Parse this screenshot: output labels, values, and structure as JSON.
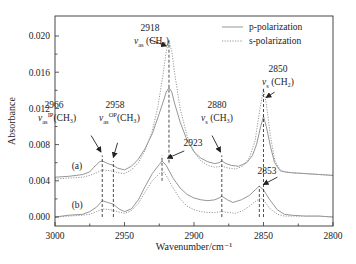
{
  "chart_data": {
    "type": "line",
    "title": "",
    "xlabel": "Wavenumber/cm⁻¹",
    "ylabel": "Absorbance",
    "xlim": [
      3000,
      2800
    ],
    "ylim": [
      -0.0005,
      0.0215
    ],
    "x_reversed": true,
    "grid": false,
    "legend_position": "upper right",
    "x_ticks": [
      3000,
      2950,
      2900,
      2850,
      2800
    ],
    "x_tick_labels": [
      "3000",
      "2950",
      "2900",
      "2850",
      "2800"
    ],
    "y_ticks": [
      0.0,
      0.004,
      0.008,
      0.012,
      0.016,
      0.02
    ],
    "y_tick_labels": [
      "0.000",
      "0.004",
      "0.008",
      "0.012",
      "0.016",
      "0.020"
    ],
    "legend": [
      {
        "name": "p-polarization",
        "style": "solid"
      },
      {
        "name": "s-polarization",
        "style": "dotted"
      }
    ],
    "series": [
      {
        "name": "(a) p-polarization",
        "group": "a",
        "style": "solid",
        "color": "#8a8a8a",
        "x": [
          3000,
          2990,
          2980,
          2975,
          2972,
          2968,
          2966,
          2962,
          2958,
          2955,
          2950,
          2945,
          2940,
          2935,
          2930,
          2926,
          2922,
          2920,
          2918,
          2916,
          2914,
          2910,
          2905,
          2900,
          2895,
          2890,
          2885,
          2882,
          2880,
          2877,
          2873,
          2868,
          2862,
          2858,
          2855,
          2852,
          2850,
          2848,
          2845,
          2842,
          2838,
          2835,
          2830,
          2820,
          2810,
          2800
        ],
        "y": [
          0.0044,
          0.0045,
          0.0047,
          0.005,
          0.0055,
          0.0061,
          0.0062,
          0.0059,
          0.0057,
          0.0054,
          0.0052,
          0.0056,
          0.0064,
          0.0076,
          0.0092,
          0.011,
          0.0128,
          0.0138,
          0.0143,
          0.0138,
          0.0126,
          0.0105,
          0.0085,
          0.0072,
          0.0065,
          0.0061,
          0.0059,
          0.006,
          0.0062,
          0.0059,
          0.0057,
          0.0056,
          0.006,
          0.0068,
          0.008,
          0.01,
          0.0111,
          0.01,
          0.0078,
          0.006,
          0.0051,
          0.005,
          0.0049,
          0.0048,
          0.0047,
          0.0046
        ]
      },
      {
        "name": "(a) s-polarization",
        "group": "a",
        "style": "dotted",
        "color": "#9a9a9a",
        "x": [
          3000,
          2990,
          2980,
          2975,
          2970,
          2966,
          2960,
          2955,
          2950,
          2945,
          2940,
          2935,
          2930,
          2926,
          2922,
          2920,
          2918,
          2916,
          2914,
          2910,
          2905,
          2900,
          2895,
          2890,
          2885,
          2880,
          2875,
          2870,
          2865,
          2860,
          2856,
          2853,
          2850,
          2848,
          2845,
          2842,
          2838,
          2835,
          2830,
          2820,
          2810,
          2800
        ],
        "y": [
          0.0042,
          0.0043,
          0.0044,
          0.0046,
          0.0049,
          0.0052,
          0.0051,
          0.0049,
          0.0048,
          0.0052,
          0.006,
          0.0074,
          0.0095,
          0.0122,
          0.016,
          0.0183,
          0.0195,
          0.0183,
          0.016,
          0.012,
          0.009,
          0.0072,
          0.0062,
          0.0057,
          0.0055,
          0.0056,
          0.0054,
          0.0053,
          0.0056,
          0.0066,
          0.0085,
          0.0115,
          0.0142,
          0.0125,
          0.009,
          0.0063,
          0.0052,
          0.005,
          0.0049,
          0.0048,
          0.0047,
          0.0046
        ]
      },
      {
        "name": "(b) p-polarization",
        "group": "b",
        "style": "solid",
        "color": "#8a8a8a",
        "x": [
          3000,
          2990,
          2980,
          2975,
          2970,
          2966,
          2962,
          2958,
          2954,
          2950,
          2945,
          2940,
          2935,
          2930,
          2925,
          2923,
          2920,
          2915,
          2910,
          2905,
          2900,
          2895,
          2890,
          2885,
          2882,
          2880,
          2876,
          2872,
          2866,
          2860,
          2856,
          2853,
          2850,
          2846,
          2840,
          2835,
          2830,
          2820,
          2810,
          2800
        ],
        "y": [
          0.0,
          0.0002,
          0.0003,
          0.0006,
          0.0011,
          0.0018,
          0.0016,
          0.0014,
          0.0009,
          0.0006,
          0.0009,
          0.0019,
          0.0034,
          0.0048,
          0.0058,
          0.0062,
          0.0057,
          0.0043,
          0.0032,
          0.0025,
          0.0021,
          0.0019,
          0.0018,
          0.0019,
          0.0021,
          0.0023,
          0.0019,
          0.0016,
          0.0019,
          0.0024,
          0.003,
          0.0034,
          0.003,
          0.002,
          0.0008,
          0.0003,
          0.0002,
          0.0001,
          0.0001,
          0.0
        ]
      },
      {
        "name": "(b) s-polarization",
        "group": "b",
        "style": "dotted",
        "color": "#9a9a9a",
        "x": [
          3000,
          2990,
          2980,
          2975,
          2970,
          2966,
          2960,
          2955,
          2950,
          2945,
          2940,
          2935,
          2930,
          2925,
          2922,
          2920,
          2915,
          2910,
          2905,
          2900,
          2895,
          2890,
          2885,
          2880,
          2875,
          2870,
          2865,
          2860,
          2856,
          2852,
          2850,
          2846,
          2840,
          2835,
          2830,
          2820,
          2810,
          2800
        ],
        "y": [
          0.0,
          0.0001,
          0.0002,
          0.0003,
          0.0006,
          0.0009,
          0.0008,
          0.0006,
          0.0004,
          0.0007,
          0.0015,
          0.0028,
          0.004,
          0.0048,
          0.005,
          0.0046,
          0.0032,
          0.002,
          0.0012,
          0.0008,
          0.0006,
          0.0005,
          0.0005,
          0.0006,
          0.0005,
          0.0004,
          0.0007,
          0.0012,
          0.0017,
          0.0021,
          0.0019,
          0.001,
          0.0003,
          0.0001,
          0.0001,
          0.0001,
          0.0001,
          0.0
        ]
      }
    ],
    "vlines": [
      {
        "x": 2966,
        "y0": 0.0,
        "y1": 0.0068
      },
      {
        "x": 2958,
        "y0": 0.0,
        "y1": 0.0062
      },
      {
        "x": 2918,
        "y0": 0.006,
        "y1": 0.0195
      },
      {
        "x": 2880,
        "y0": 0.0,
        "y1": 0.0068
      },
      {
        "x": 2850,
        "y0": 0.0,
        "y1": 0.0142
      },
      {
        "x": 2923,
        "y0": 0.004,
        "y1": 0.0068
      },
      {
        "x": 2853,
        "y0": 0.0,
        "y1": 0.0034
      }
    ],
    "annotations": [
      {
        "id": "a2966",
        "num": "2966",
        "mode": "ν",
        "sub": "as",
        "sup": "ip",
        "group": "(CH₃)",
        "tx": 44,
        "ty": 0.012,
        "ax1": 2974,
        "ay1": 0.009,
        "ax2": 2967,
        "ay2": 0.0072
      },
      {
        "id": "a2958",
        "num": "2958",
        "mode": "ν",
        "sub": "as",
        "sup": "op",
        "group": "(CH₃)",
        "tx": 105,
        "ty": 0.012,
        "ax1": 2955,
        "ay1": 0.0082,
        "ax2": 2958,
        "ay2": 0.0066
      },
      {
        "id": "a2918",
        "num": "2918",
        "mode": "ν",
        "sub": "as",
        "sup": "",
        "group": "(CH₂)",
        "tx": 140,
        "ty": 0.0205,
        "ax1": 2932,
        "ay1": 0.0196,
        "ax2": 2920,
        "ay2": 0.0189
      },
      {
        "id": "a2880",
        "num": "2880",
        "mode": "ν",
        "sub": "s",
        "sup": "",
        "group": "(CH₃)",
        "tx": 207,
        "ty": 0.012,
        "ax1": 2887,
        "ay1": 0.009,
        "ax2": 2881,
        "ay2": 0.0072
      },
      {
        "id": "a2850",
        "num": "2850",
        "mode": "ν",
        "sub": "s",
        "sup": "",
        "group": "(CH₂)",
        "tx": 268,
        "ty": 0.016,
        "ax1": 2842,
        "ay1": 0.0138,
        "ax2": 2848,
        "ay2": 0.0132
      },
      {
        "id": "a2923",
        "num": "2923",
        "mode": "",
        "sub": "",
        "sup": "",
        "group": "",
        "tx": 183,
        "ty": 0.0078,
        "ax1": 2907,
        "ay1": 0.0073,
        "ax2": 2919,
        "ay2": 0.0065
      },
      {
        "id": "a2853",
        "num": "2853",
        "mode": "",
        "sub": "",
        "sup": "",
        "group": "",
        "tx": 257,
        "ty": 0.0048,
        "ax1": 2840,
        "ay1": 0.0044,
        "ax2": 2850,
        "ay2": 0.0036
      }
    ],
    "curve_labels": [
      {
        "text": "(a)",
        "x": 2988,
        "y": 0.0053
      },
      {
        "text": "(b)",
        "x": 2988,
        "y": 0.001
      }
    ]
  }
}
